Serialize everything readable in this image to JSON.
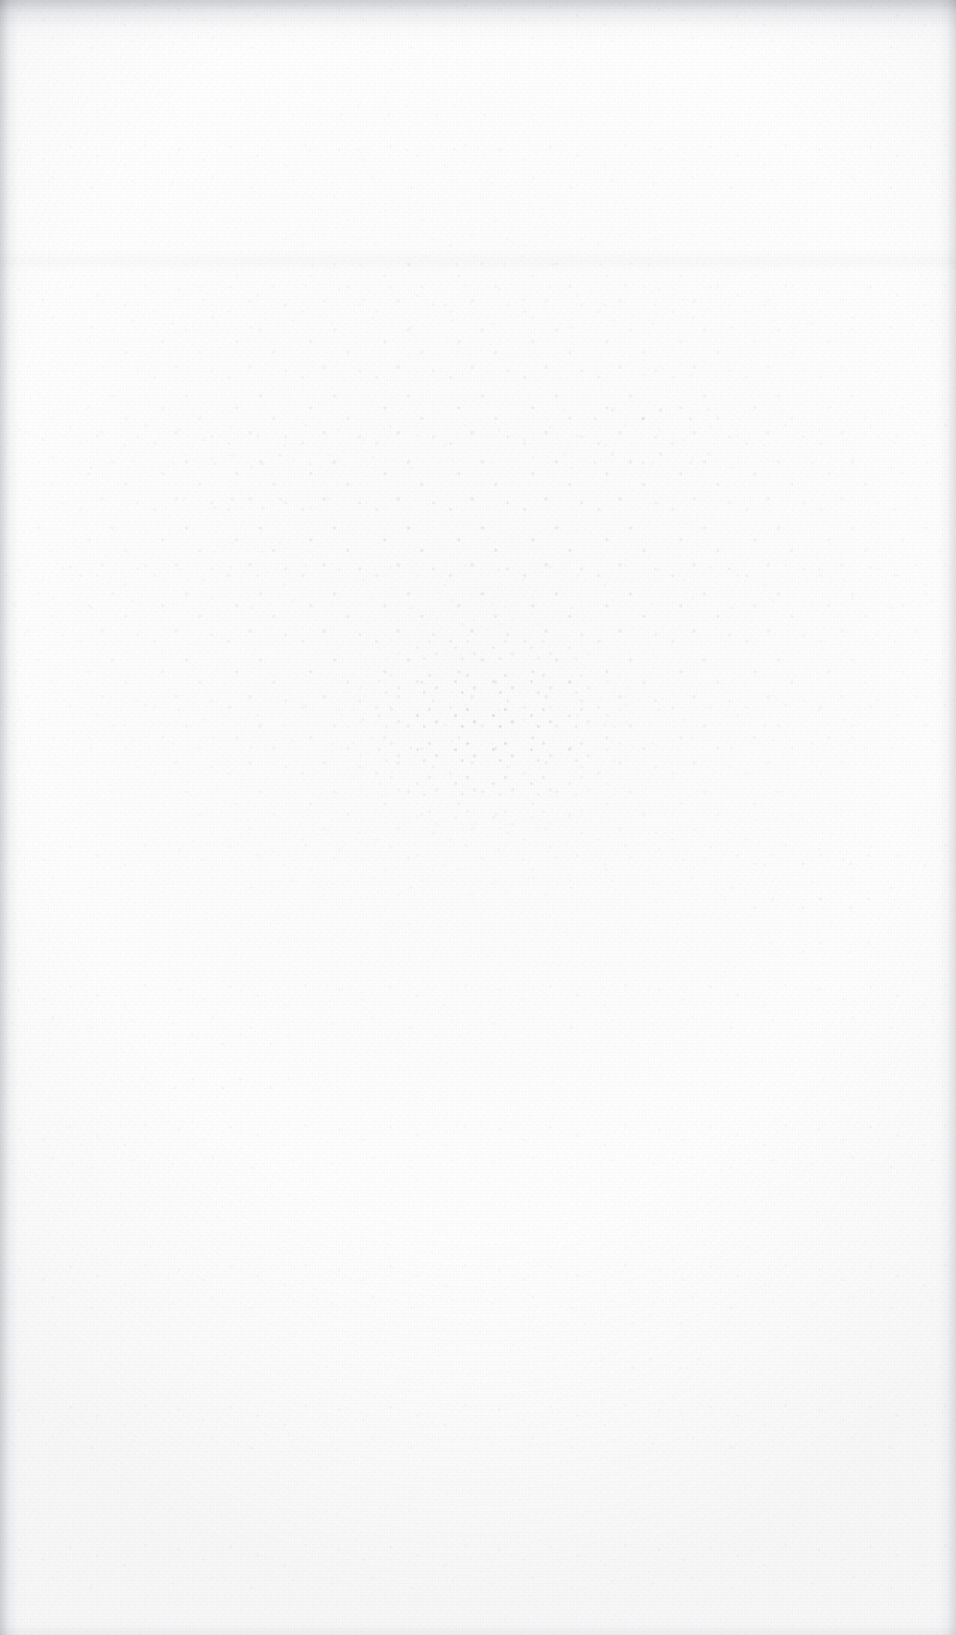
{
  "document": {
    "kind": "blank-scanned-page",
    "title": "",
    "body_text": "",
    "visible_text": "",
    "page_number": ""
  },
  "canvas": {
    "width": 956,
    "height": 1635,
    "orientation": "portrait"
  },
  "appearance": {
    "background_color": "#ffffff",
    "paper_tone": "#fdfdfd",
    "grain_color": "#96969b",
    "speckle_color": "#6e7078",
    "edge_shadow_color": "#cdced2",
    "top_band_color": "#d8d9dc",
    "vignette_color": "#c6c8ce"
  },
  "regions": {
    "top_edge_band": {
      "label": "top-edge-shadow",
      "height_px": 46
    },
    "left_edge_band": {
      "label": "left-edge-shadow",
      "width_px": 26
    },
    "right_edge_band": {
      "label": "right-edge-shadow",
      "width_px": 24
    },
    "bottom_edge_band": {
      "label": "bottom-edge-shadow",
      "height_px": 18
    },
    "speckle_cloud": {
      "label": "upper-center-grain-cloud",
      "top_px": 190,
      "height_px": 760
    },
    "speckle_core": {
      "label": "center-dense-speckle",
      "left_px": 330,
      "top_px": 600,
      "width_px": 330,
      "height_px": 250
    },
    "tonal_band": {
      "label": "faint-horizontal-seam",
      "top_px": 250,
      "height_px": 22
    }
  }
}
